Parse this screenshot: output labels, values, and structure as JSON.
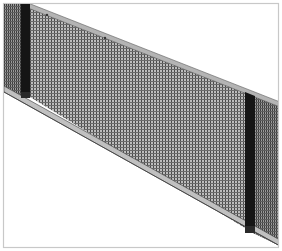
{
  "figure": {
    "background": "#ffffff",
    "border_color": "#c8c8c8",
    "colors": {
      "mesh": "#6e6e6e",
      "mesh_light": "#a9a9a9",
      "post": "#151515",
      "rail": "#b4b4b4",
      "rail_edge": "#5a5a5a"
    },
    "components": [
      {
        "name": "left-mesh-segment",
        "description": "partial mesh panel left of first post"
      },
      {
        "name": "left-post",
        "description": "dark vertical post"
      },
      {
        "name": "main-mesh-panel",
        "description": "large sloped mesh panel"
      },
      {
        "name": "right-post",
        "description": "dark vertical post"
      },
      {
        "name": "right-mesh-segment",
        "description": "partial mesh panel right of second post"
      },
      {
        "name": "top-rail",
        "description": "sloped top rail"
      },
      {
        "name": "bottom-rail",
        "description": "sloped bottom rail / base plinth"
      }
    ]
  }
}
